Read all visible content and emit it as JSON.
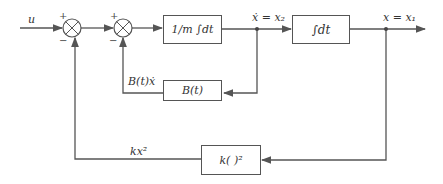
{
  "diagram": {
    "input_label": "u",
    "summer1": {
      "plus": "+",
      "minus": "−"
    },
    "summer2": {
      "plus": "+",
      "minus": "−"
    },
    "block_integrator1": {
      "label": "1/m ∫dt"
    },
    "block_integrator2": {
      "label": "∫dt"
    },
    "block_damping": {
      "label": "B(t)"
    },
    "block_spring": {
      "label": "k(  )²"
    },
    "signal_velocity": "ẋ = x₂",
    "signal_position": "x = x₁",
    "signal_damping_feedback": "B(t)ẋ",
    "signal_spring_feedback": "kx²",
    "line_color": "#555555"
  }
}
